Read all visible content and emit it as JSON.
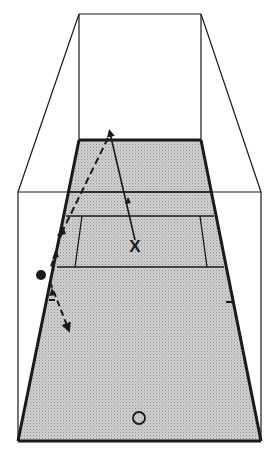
{
  "diagram": {
    "title": "Squash court perspective diagram",
    "colors": {
      "line": "#1a1a1a",
      "floor": "#c9c9c9",
      "floor_dot": "#9a9a9a",
      "background": "#ffffff"
    },
    "labels": {
      "player_x": "X",
      "player_o": "O"
    },
    "elements": {
      "front_wall": "front-wall",
      "side_walls": "side-walls",
      "floor": "court-floor",
      "service_box": "service-box",
      "shot_path_solid": "Ball path from X to front wall",
      "shot_path_dashed": "Ball path from front wall via side wall",
      "ball": "ball"
    }
  }
}
